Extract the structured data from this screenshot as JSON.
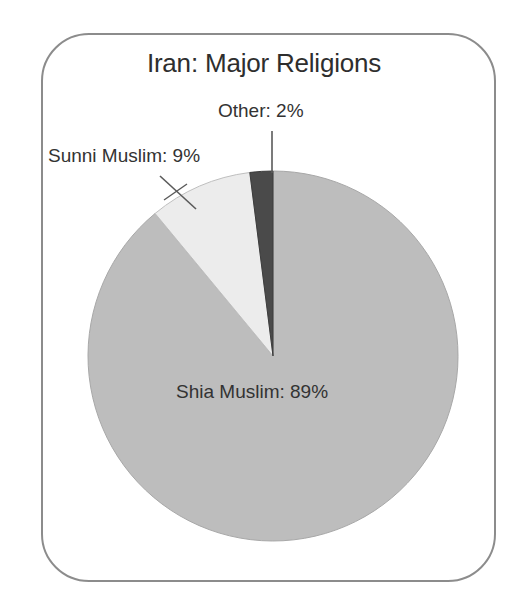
{
  "figure": {
    "title": "Iran: Major Religions",
    "frame_color": "#8c8c8c",
    "background": "#ffffff"
  },
  "chart_data": {
    "type": "pie",
    "title": "Iran: Major Religions",
    "xlabel": "",
    "ylabel": "",
    "categories": [
      "Shia Muslim",
      "Sunni Muslim",
      "Other"
    ],
    "values": [
      89,
      9,
      2
    ],
    "unit": "%",
    "labels": [
      "Shia Muslim: 89%",
      "Sunni Muslim: 9%",
      "Other: 2%"
    ],
    "colors": [
      "#bdbdbd",
      "#ececec",
      "#4a4a4a"
    ],
    "start_angle_deg": 90,
    "direction": "clockwise-from-top-reversed",
    "legend": "none",
    "grid": false,
    "slices": [
      {
        "name": "Shia Muslim",
        "value": 89,
        "label": "Shia Muslim: 89%",
        "color": "#bdbdbd",
        "label_position": "inside"
      },
      {
        "name": "Sunni Muslim",
        "value": 9,
        "label": "Sunni Muslim: 9%",
        "color": "#ececec",
        "label_position": "outside-left",
        "leader_line": true
      },
      {
        "name": "Other",
        "value": 2,
        "label": "Other: 2%",
        "color": "#4a4a4a",
        "label_position": "outside-top",
        "leader_line": true
      }
    ]
  }
}
